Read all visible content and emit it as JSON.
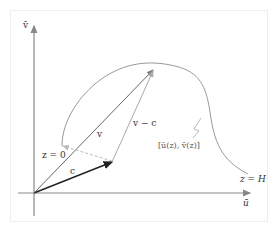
{
  "diagram": {
    "axes": {
      "x_label": "ū",
      "y_label": "v̄"
    },
    "curve": {
      "start_label": "z = 0",
      "end_label": "z = H",
      "point_label": "[ū(z), v̄(z)]"
    },
    "vectors": {
      "c": "c",
      "v": "v",
      "v_minus_c": "v − c"
    },
    "colors": {
      "axis": "#888888",
      "curve": "#999999",
      "vector_c": "#222222",
      "vector_v": "#666666",
      "vector_vmc": "#aaaaaa",
      "dashed": "#bbbbbb"
    }
  }
}
